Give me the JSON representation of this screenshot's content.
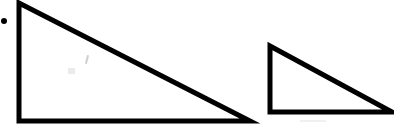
{
  "canvas": {
    "width": 394,
    "height": 137,
    "background_color": "#ffffff",
    "ink_color": "#000000",
    "description": "Two black outlined right triangles on a white background"
  },
  "marks": {
    "bullet_dot": {
      "label": "bullet-dot",
      "cx": 4,
      "cy": 21,
      "r": 3,
      "color": "#000000"
    }
  },
  "shapes": [
    {
      "name": "large-right-triangle",
      "type": "right-triangle",
      "stroke_color": "#000000",
      "stroke_width": 5,
      "fill": "none",
      "points": "19,3 19,121 250,121",
      "vertices": [
        {
          "label": "apex",
          "x": 19,
          "y": 3
        },
        {
          "label": "right-angle",
          "x": 19,
          "y": 121
        },
        {
          "label": "far-tip",
          "x": 250,
          "y": 121
        }
      ],
      "base_length": 231,
      "height_length": 118
    },
    {
      "name": "small-right-triangle",
      "type": "right-triangle",
      "stroke_color": "#000000",
      "stroke_width": 5,
      "fill": "none",
      "points": "270,46 270,112 392,112",
      "vertices": [
        {
          "label": "apex",
          "x": 270,
          "y": 46
        },
        {
          "label": "right-angle",
          "x": 270,
          "y": 112
        },
        {
          "label": "far-tip",
          "x": 392,
          "y": 112
        }
      ],
      "base_length": 122,
      "height_length": 66
    }
  ],
  "artifacts": [
    {
      "name": "pencil-smudge-upper",
      "x": 86,
      "y": 55
    },
    {
      "name": "pencil-smudge-mid",
      "x": 68,
      "y": 68
    },
    {
      "name": "paper-scuff-lower-right",
      "x": 300,
      "y": 120
    }
  ]
}
